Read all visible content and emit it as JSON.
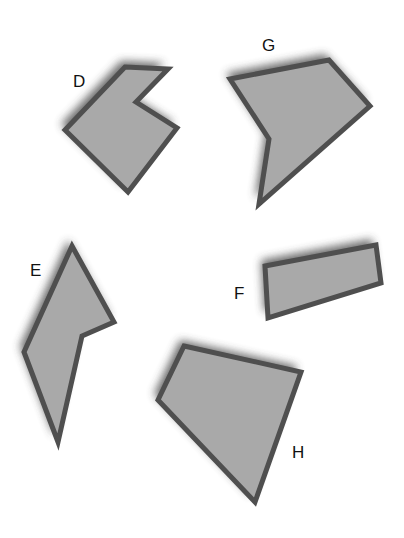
{
  "canvas": {
    "width": 404,
    "height": 538,
    "background": "#ffffff"
  },
  "style": {
    "fill": "#a9a9a9",
    "stroke": "#4f4f4f",
    "stroke_width": 5,
    "shadow_color": "#3a3a3a",
    "label_color": "#111111"
  },
  "shapes": [
    {
      "id": "D",
      "label": "D",
      "label_pos": [
        73,
        73
      ],
      "points": [
        [
          125,
          67
        ],
        [
          168,
          69
        ],
        [
          136,
          102
        ],
        [
          177,
          128
        ],
        [
          128,
          192
        ],
        [
          65,
          130
        ]
      ]
    },
    {
      "id": "G",
      "label": "G",
      "label_pos": [
        262,
        37
      ],
      "points": [
        [
          230,
          79
        ],
        [
          329,
          60
        ],
        [
          370,
          106
        ],
        [
          259,
          204
        ],
        [
          269,
          139
        ]
      ]
    },
    {
      "id": "E",
      "label": "E",
      "label_pos": [
        30,
        262
      ],
      "points": [
        [
          72,
          246
        ],
        [
          114,
          322
        ],
        [
          82,
          336
        ],
        [
          58,
          442
        ],
        [
          24,
          352
        ]
      ]
    },
    {
      "id": "F",
      "label": "F",
      "label_pos": [
        234,
        285
      ],
      "points": [
        [
          265,
          266
        ],
        [
          376,
          245
        ],
        [
          381,
          283
        ],
        [
          268,
          318
        ]
      ]
    },
    {
      "id": "H",
      "label": "H",
      "label_pos": [
        292,
        444
      ],
      "points": [
        [
          184,
          346
        ],
        [
          301,
          372
        ],
        [
          255,
          502
        ],
        [
          158,
          400
        ]
      ]
    }
  ]
}
